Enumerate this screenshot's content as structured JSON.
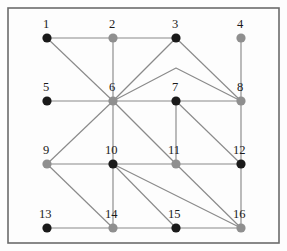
{
  "figure": {
    "background_color": "#fdfdfd",
    "border_color": "#6b6b6b",
    "edge_color": "#8a8a8a",
    "label_color": "#1a1a1a",
    "node_colors": {
      "black": "#1a1a1a",
      "gray": "#8f8f8f"
    },
    "node_radius": 4.6,
    "border": {
      "x": 8,
      "y": 8,
      "width": 271,
      "height": 235
    }
  },
  "graph_data": {
    "type": "node-link-diagram",
    "node_count": 16,
    "edge_count": 33,
    "nodes": [
      {
        "id": 1,
        "label": "1",
        "x": 47,
        "y": 38,
        "color": "black",
        "label_x": 43,
        "label_y": 28
      },
      {
        "id": 2,
        "label": "2",
        "x": 113,
        "y": 38,
        "color": "gray",
        "label_x": 109,
        "label_y": 28
      },
      {
        "id": 3,
        "label": "3",
        "x": 176,
        "y": 38,
        "color": "black",
        "label_x": 172,
        "label_y": 28
      },
      {
        "id": 4,
        "label": "4",
        "x": 241,
        "y": 38,
        "color": "gray",
        "label_x": 237,
        "label_y": 28
      },
      {
        "id": 5,
        "label": "5",
        "x": 47,
        "y": 101,
        "color": "black",
        "label_x": 43,
        "label_y": 91
      },
      {
        "id": 6,
        "label": "6",
        "x": 113,
        "y": 101,
        "color": "gray",
        "label_x": 109,
        "label_y": 91
      },
      {
        "id": 7,
        "label": "7",
        "x": 176,
        "y": 101,
        "color": "black",
        "label_x": 172,
        "label_y": 91
      },
      {
        "id": 8,
        "label": "8",
        "x": 241,
        "y": 101,
        "color": "gray",
        "label_x": 237,
        "label_y": 91
      },
      {
        "id": 9,
        "label": "9",
        "x": 47,
        "y": 164,
        "color": "gray",
        "label_x": 43,
        "label_y": 154
      },
      {
        "id": 10,
        "label": "10",
        "x": 113,
        "y": 164,
        "color": "black",
        "label_x": 105,
        "label_y": 154
      },
      {
        "id": 11,
        "label": "11",
        "x": 176,
        "y": 164,
        "color": "gray",
        "label_x": 168,
        "label_y": 154
      },
      {
        "id": 12,
        "label": "12",
        "x": 241,
        "y": 164,
        "color": "black",
        "label_x": 233,
        "label_y": 154
      },
      {
        "id": 13,
        "label": "13",
        "x": 47,
        "y": 228,
        "color": "black",
        "label_x": 39,
        "label_y": 218
      },
      {
        "id": 14,
        "label": "14",
        "x": 113,
        "y": 228,
        "color": "gray",
        "label_x": 105,
        "label_y": 218
      },
      {
        "id": 15,
        "label": "15",
        "x": 176,
        "y": 228,
        "color": "black",
        "label_x": 168,
        "label_y": 218
      },
      {
        "id": 16,
        "label": "16",
        "x": 241,
        "y": 228,
        "color": "gray",
        "label_x": 233,
        "label_y": 218
      }
    ],
    "edges": [
      {
        "source": 1,
        "target": 2
      },
      {
        "source": 2,
        "target": 3
      },
      {
        "source": 1,
        "target": 6
      },
      {
        "source": 2,
        "target": 6
      },
      {
        "source": 3,
        "target": 6
      },
      {
        "source": 3,
        "target": 8
      },
      {
        "source": 4,
        "target": 8
      },
      {
        "source": 5,
        "target": 6
      },
      {
        "source": 6,
        "target": 7
      },
      {
        "source": 7,
        "target": 8
      },
      {
        "source": 6,
        "target": 9
      },
      {
        "source": 6,
        "target": 10
      },
      {
        "source": 6,
        "target": 11
      },
      {
        "source": 7,
        "target": 11
      },
      {
        "source": 7,
        "target": 12
      },
      {
        "source": 8,
        "target": 12
      },
      {
        "source": 9,
        "target": 10
      },
      {
        "source": 10,
        "target": 11
      },
      {
        "source": 11,
        "target": 12
      },
      {
        "source": 9,
        "target": 14
      },
      {
        "source": 10,
        "target": 14
      },
      {
        "source": 10,
        "target": 15
      },
      {
        "source": 10,
        "target": 16
      },
      {
        "source": 11,
        "target": 16
      },
      {
        "source": 12,
        "target": 16
      },
      {
        "source": 13,
        "target": 14
      },
      {
        "source": 14,
        "target": 15
      },
      {
        "source": 15,
        "target": 16
      }
    ],
    "bent_edges": [
      {
        "source": 6,
        "target": 8,
        "apex_x": 176,
        "apex_y": 68
      }
    ]
  }
}
